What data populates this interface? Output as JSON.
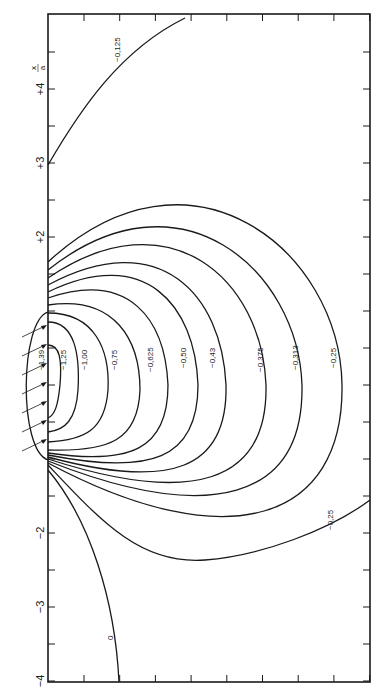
{
  "figure": {
    "axis_label_numerator": "x",
    "axis_label_denominator": "a",
    "axis_ticks": [
      {
        "value": 4,
        "label": "+4"
      },
      {
        "value": 3,
        "label": "+3"
      },
      {
        "value": 2,
        "label": "+2"
      },
      {
        "value": -2,
        "label": "−2"
      },
      {
        "value": -3,
        "label": "−3"
      },
      {
        "value": -4,
        "label": "−4"
      }
    ],
    "x_range": [
      -4,
      4.8
    ],
    "contour_labels": [
      {
        "id": "c139",
        "label": "−1,39"
      },
      {
        "id": "c125",
        "label": "−1,25"
      },
      {
        "id": "c100",
        "label": "−1,00"
      },
      {
        "id": "c075",
        "label": "−0,75"
      },
      {
        "id": "c0625",
        "label": "−0,625"
      },
      {
        "id": "c050",
        "label": "−0,50"
      },
      {
        "id": "c043",
        "label": "−0,43"
      },
      {
        "id": "c0375",
        "label": "−0,375"
      },
      {
        "id": "c0313",
        "label": "−0,313"
      },
      {
        "id": "c025a",
        "label": "−0,25"
      },
      {
        "id": "c025b",
        "label": "−0,25"
      },
      {
        "id": "c0125",
        "label": "−0,125"
      },
      {
        "id": "c0",
        "label": "0"
      }
    ],
    "arrow_count": 7
  }
}
